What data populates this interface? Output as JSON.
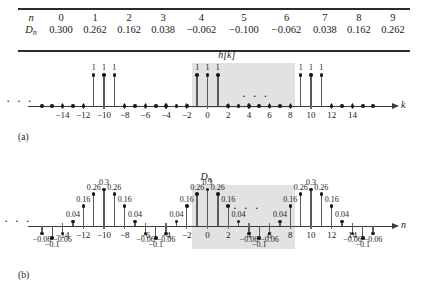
{
  "table": {
    "rows": [
      {
        "head": "n",
        "head_sub": "",
        "cells": [
          "0",
          "1",
          "2",
          "3",
          "4",
          "5",
          "6",
          "7",
          "8",
          "9"
        ]
      },
      {
        "head": "D",
        "head_sub": "n",
        "cells": [
          "0.300",
          "0.262",
          "0.162",
          "0.038",
          "−0.062",
          "−0.100",
          "−0.062",
          "0.038",
          "0.162",
          "0.262"
        ]
      }
    ]
  },
  "panel_a": {
    "caption": "(a)",
    "title": "h[k]",
    "axis_label": "k",
    "leading_ellipsis": "· · ·",
    "inner_ellipsis": "· · ·",
    "tick_labels": [
      "−14",
      "−12",
      "−10",
      "−8",
      "−6",
      "−4",
      "−2",
      "0",
      "2",
      "4",
      "6",
      "8",
      "10",
      "12",
      "14"
    ],
    "tick_values": [
      -14,
      -12,
      -10,
      -8,
      -6,
      -4,
      -2,
      0,
      2,
      4,
      6,
      8,
      10,
      12,
      14
    ],
    "stem_label": "1",
    "shade_from": -1.5,
    "shade_to": 8.5
  },
  "panel_b": {
    "caption": "(b)",
    "title": "D",
    "title_sub": "n",
    "axis_label": "n",
    "leading_ellipsis": "· · ·",
    "inner_ellipsis": "· · ·",
    "tick_labels": [
      "−14",
      "−12",
      "−10",
      "−8",
      "−6",
      "−4",
      "−2",
      "0",
      "2",
      "4",
      "6",
      "8",
      "10",
      "12",
      "14"
    ],
    "tick_values": [
      -14,
      -12,
      -10,
      -8,
      -6,
      -4,
      -2,
      0,
      2,
      4,
      6,
      8,
      10,
      12,
      14
    ],
    "shade_from": -1.5,
    "shade_to": 8.5
  },
  "chart_data": [
    {
      "type": "stem",
      "id": "panel-a",
      "title": "h[k]",
      "xlabel": "k",
      "ylabel": "",
      "xlim": [
        -16,
        16
      ],
      "ylim": [
        0,
        1.25
      ],
      "grid": false,
      "legend": "none",
      "note": "Impulse train h[k]: unit impulses at k = -11,-10,-9, -1,0,1, 9,10,11; zero elsewhere. Highlighted window spans k = -1.5 to 8.5 (one period of length 10).",
      "x": [
        -16,
        -15,
        -14,
        -13,
        -12,
        -11,
        -10,
        -9,
        -8,
        -7,
        -6,
        -5,
        -4,
        -3,
        -2,
        -1,
        0,
        1,
        2,
        3,
        4,
        5,
        6,
        7,
        8,
        9,
        10,
        11,
        12,
        13,
        14,
        15,
        16
      ],
      "values": [
        0,
        0,
        0,
        0,
        0,
        1,
        1,
        1,
        0,
        0,
        0,
        0,
        0,
        0,
        0,
        1,
        1,
        1,
        0,
        0,
        0,
        0,
        0,
        0,
        0,
        1,
        1,
        1,
        0,
        0,
        0,
        0,
        0
      ],
      "nonzero_label": "1"
    },
    {
      "type": "stem",
      "id": "panel-b",
      "title": "D_n",
      "xlabel": "n",
      "ylabel": "",
      "xlim": [
        -16,
        16
      ],
      "ylim": [
        -0.14,
        0.36
      ],
      "grid": false,
      "legend": "none",
      "note": "Periodic DFT coefficient sequence D_n, period 10, values per period: 0.300, 0.262, 0.162, 0.038, -0.062, -0.100, -0.062, 0.038, 0.162, 0.262. Highlighted window spans n = -1.5 to 8.5.",
      "x": [
        -16,
        -15,
        -14,
        -13,
        -12,
        -11,
        -10,
        -9,
        -8,
        -7,
        -6,
        -5,
        -4,
        -3,
        -2,
        -1,
        0,
        1,
        2,
        3,
        4,
        5,
        6,
        7,
        8,
        9,
        10,
        11,
        12,
        13,
        14,
        15,
        16
      ],
      "values": [
        -0.062,
        -0.1,
        -0.062,
        0.038,
        0.162,
        0.262,
        0.3,
        0.262,
        0.162,
        0.038,
        -0.062,
        -0.1,
        -0.062,
        0.038,
        0.162,
        0.262,
        0.3,
        0.262,
        0.162,
        0.038,
        -0.062,
        -0.1,
        -0.062,
        0.038,
        0.162,
        0.262,
        0.3,
        0.262,
        0.162,
        0.038,
        -0.062,
        -0.1,
        -0.062
      ],
      "point_labels": [
        "−0.06",
        "−0.1",
        "−0.06",
        "0.04",
        "0.16",
        "0.26",
        "0.3",
        "0.26",
        "0.16",
        "0.04",
        "−0.06",
        "−0.1",
        "−0.06",
        "0.04",
        "0.16",
        "0.26",
        "0.3",
        "0.26",
        "0.16",
        "0.04",
        "−0.06",
        "−0.1",
        "−0.06",
        "0.04",
        "0.16",
        "0.26",
        "0.3",
        "0.26",
        "0.16",
        "0.04",
        "−0.06",
        "−0.1",
        "−0.06"
      ]
    }
  ]
}
